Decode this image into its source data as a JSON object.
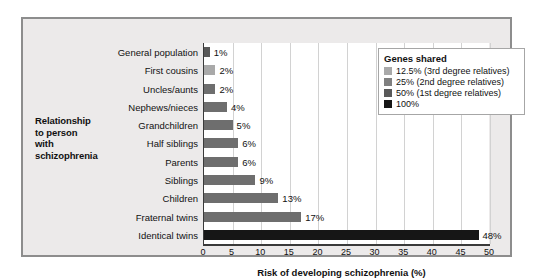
{
  "chart_data": {
    "type": "bar",
    "orientation": "horizontal",
    "title": "",
    "xlabel": "Risk of developing schizophrenia (%)",
    "ylabel": "Relationship to person with schizophrenia",
    "ylabel_lines": [
      "Relationship",
      "to person",
      "with",
      "schizophrenia"
    ],
    "xlim": [
      0,
      50
    ],
    "xticks": [
      0,
      5,
      10,
      15,
      20,
      25,
      30,
      35,
      40,
      45,
      50
    ],
    "xtick_labels": [
      "0",
      "5",
      "10",
      "15",
      "20",
      "25",
      "30",
      "35",
      "40",
      "45",
      "50"
    ],
    "grid": "vertical",
    "legend_position": "top-right",
    "categories": [
      "General population",
      "First cousins",
      "Uncles/aunts",
      "Nephews/nieces",
      "Grandchildren",
      "Half siblings",
      "Parents",
      "Siblings",
      "Children",
      "Fraternal twins",
      "Identical twins"
    ],
    "values": [
      1,
      2,
      2,
      4,
      5,
      6,
      6,
      9,
      13,
      17,
      48
    ],
    "value_labels": [
      "1%",
      "2%",
      "2%",
      "4%",
      "5%",
      "6%",
      "6%",
      "9%",
      "13%",
      "17%",
      "48%"
    ],
    "bar_colors": [
      "#595959",
      "#a9a9a9",
      "#6e6e6e",
      "#6e6e6e",
      "#6e6e6e",
      "#6e6e6e",
      "#6e6e6e",
      "#6e6e6e",
      "#6e6e6e",
      "#6e6e6e",
      "#161616"
    ],
    "genes_shared_group": [
      "50%",
      "12.5%",
      "25%",
      "25%",
      "25%",
      "25%",
      "50%",
      "50%",
      "50%",
      "50%",
      "100%"
    ]
  },
  "legend": {
    "title": "Genes shared",
    "items": [
      {
        "label": "12.5% (3rd degree relatives)",
        "color": "#a9a9a9"
      },
      {
        "label": "25% (2nd degree relatives)",
        "color": "#808080"
      },
      {
        "label": "50% (1st degree relatives)",
        "color": "#595959"
      },
      {
        "label": "100%",
        "color": "#161616"
      }
    ]
  },
  "colors": {
    "figure_background": "#eceaea",
    "figure_border": "#8d8d8d",
    "plot_background": "#ffffff",
    "gridline": "#d2d2d2",
    "axis": "#3a3a3a",
    "text": "#111111"
  }
}
